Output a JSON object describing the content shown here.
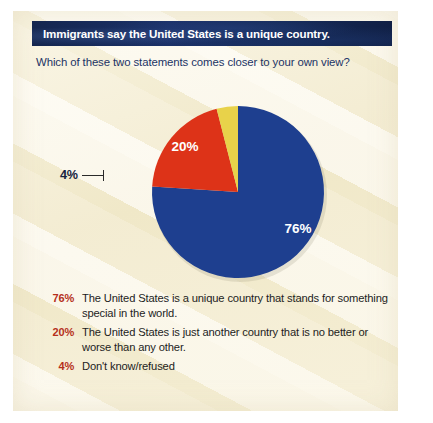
{
  "title": {
    "text": "Immigrants say the United States is a unique country.",
    "bar_color": "#15295a",
    "text_color": "#ffffff"
  },
  "subtitle": {
    "text": "Which of these two statements comes closer to your own view?",
    "color": "#1b3365"
  },
  "background": {
    "panel_color": "#f7f1dd",
    "frame_color": "#ffffff"
  },
  "callout": {
    "label": "4%",
    "color": "#16233f"
  },
  "legend": {
    "pct_color": "#b5301b",
    "text_color": "#1d1d1d",
    "rows": [
      {
        "pct": "76%",
        "text": "The United States is a unique country that stands for something special in the world.",
        "color": "#1e3f8f"
      },
      {
        "pct": "20%",
        "text": "The United States is just another country that is no better or worse than any other.",
        "color": "#dd3318"
      },
      {
        "pct": "4%",
        "text": "Don't know/refused",
        "color": "#e8d24a"
      }
    ]
  },
  "chart_data": {
    "type": "pie",
    "title": "Immigrants say the United States is a unique country.",
    "subtitle": "Which of these two statements comes closer to your own view?",
    "categories": [
      "The United States is a unique country that stands for something special in the world.",
      "The United States is just another country that is no better or worse than any other.",
      "Don't know/refused"
    ],
    "values": [
      76,
      20,
      4
    ],
    "value_labels": [
      "76%",
      "20%",
      "4%"
    ],
    "colors": [
      "#1e3f8f",
      "#dd3318",
      "#e8d24a"
    ],
    "units": "percent",
    "start_angle_deg": 0,
    "direction": "clockwise",
    "legend_position": "below",
    "grid": false,
    "inner_labels": [
      {
        "label": "76%",
        "slice": 0,
        "placement": "inside"
      },
      {
        "label": "20%",
        "slice": 1,
        "placement": "inside"
      },
      {
        "label": "4%",
        "slice": 2,
        "placement": "outside-left-leader"
      }
    ]
  }
}
